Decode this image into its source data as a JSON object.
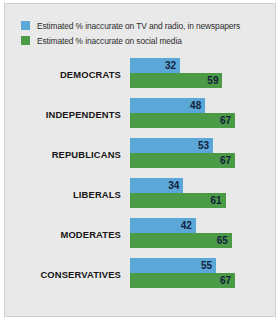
{
  "chart_data": {
    "type": "bar",
    "orientation": "horizontal",
    "title": "",
    "xlabel": "",
    "ylabel": "",
    "xlim": [
      0,
      67
    ],
    "grid": false,
    "legend_position": "top-left",
    "categories": [
      "DEMOCRATS",
      "INDEPENDENTS",
      "REPUBLICANS",
      "LIBERALS",
      "MODERATES",
      "CONSERVATIVES"
    ],
    "series": [
      {
        "name": "Estimated % inaccurate on TV and radio, in newspapers",
        "color": "#5ba8d8",
        "values": [
          32,
          48,
          53,
          34,
          42,
          55
        ]
      },
      {
        "name": "Estimated % inaccurate on social media",
        "color": "#4a9a46",
        "values": [
          59,
          67,
          67,
          61,
          65,
          67
        ]
      }
    ]
  },
  "legend": {
    "items": [
      {
        "label": "Estimated % inaccurate on TV and radio, in newspapers",
        "color": "#5ba8d8"
      },
      {
        "label": "Estimated % inaccurate on social media",
        "color": "#4a9a46"
      }
    ]
  },
  "colors": {
    "blue": "#5ba8d8",
    "green": "#4a9a46",
    "panel_background": "#e9e9e9",
    "panel_border": "#cfcfcf",
    "value_text": "#14213d",
    "category_text": "#161616"
  }
}
